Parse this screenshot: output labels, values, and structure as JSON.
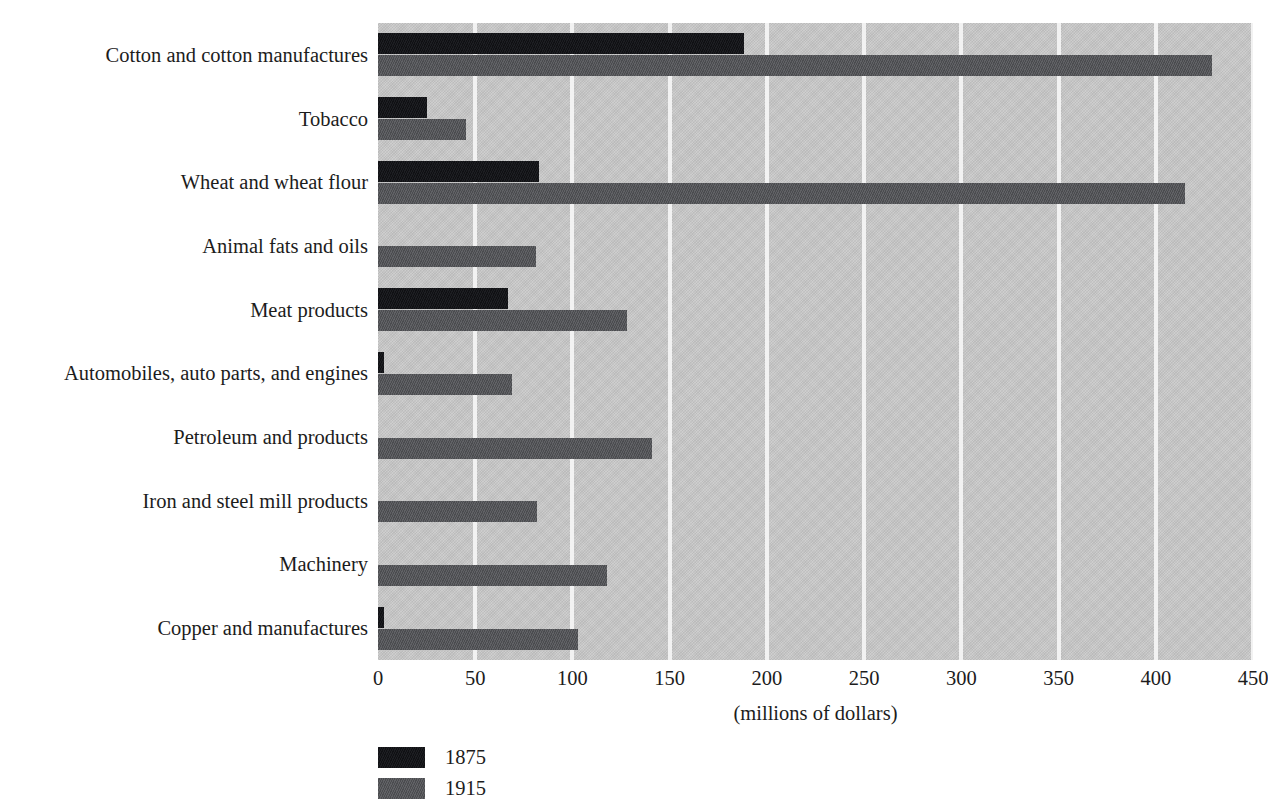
{
  "chart_data": {
    "type": "bar",
    "orientation": "horizontal",
    "title": "",
    "subtitle": "",
    "xlabel": "(millions of dollars)",
    "ylabel": "",
    "xlim": [
      0,
      450
    ],
    "xticks": [
      0,
      50,
      100,
      150,
      200,
      250,
      300,
      350,
      400,
      450
    ],
    "xtick_labels": [
      "0",
      "50",
      "100",
      "150",
      "200",
      "250",
      "300",
      "350",
      "400",
      "450"
    ],
    "grid": "vertical",
    "legend_position": "below-left",
    "categories": [
      "Cotton and cotton manufactures",
      "Tobacco",
      "Wheat and wheat flour",
      "Animal fats and oils",
      "Meat products",
      "Automobiles, auto parts, and engines",
      "Petroleum and products",
      "Iron and steel mill products",
      "Machinery",
      "Copper and manufactures"
    ],
    "series": [
      {
        "name": "1875",
        "color": "#15161a",
        "values": [
          188,
          25,
          83,
          0,
          67,
          3,
          0,
          0,
          0,
          3
        ]
      },
      {
        "name": "1915",
        "color": "#55565a",
        "values": [
          429,
          45,
          415,
          81,
          128,
          69,
          141,
          82,
          118,
          103
        ]
      }
    ],
    "colors": {
      "plot_background": "#c9c9c9",
      "gridline": "#f2f2f2",
      "page_background": "#ffffff",
      "text": "#1c1c1c",
      "series_1875": "#15161a",
      "series_1915": "#55565a"
    }
  },
  "legend": {
    "items": [
      {
        "label": "1875",
        "swatch": "series-1875-swatch"
      },
      {
        "label": "1915",
        "swatch": "series-1915-swatch"
      }
    ]
  },
  "axis": {
    "x_title": "(millions of dollars)"
  }
}
